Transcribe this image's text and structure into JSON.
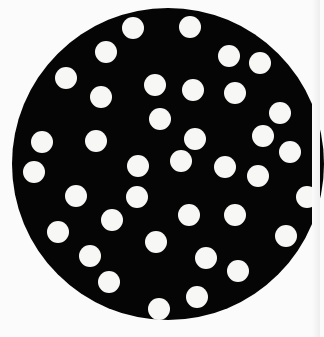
{
  "image": {
    "description": "Black circular disc with scattered white dots on a white background",
    "background_color": "#fbfbfb",
    "disc": {
      "cx": 168,
      "cy": 164,
      "r": 156,
      "color": "#050505"
    },
    "dot_color": "#f7f7f5",
    "dot_radius": 11,
    "dots": [
      {
        "x": 133,
        "y": 28
      },
      {
        "x": 190,
        "y": 27
      },
      {
        "x": 106,
        "y": 52
      },
      {
        "x": 229,
        "y": 56
      },
      {
        "x": 260,
        "y": 63
      },
      {
        "x": 66,
        "y": 78
      },
      {
        "x": 155,
        "y": 85
      },
      {
        "x": 193,
        "y": 90
      },
      {
        "x": 235,
        "y": 93
      },
      {
        "x": 101,
        "y": 97
      },
      {
        "x": 160,
        "y": 119
      },
      {
        "x": 280,
        "y": 113
      },
      {
        "x": 42,
        "y": 142
      },
      {
        "x": 96,
        "y": 141
      },
      {
        "x": 195,
        "y": 139
      },
      {
        "x": 263,
        "y": 136
      },
      {
        "x": 290,
        "y": 152
      },
      {
        "x": 34,
        "y": 172
      },
      {
        "x": 138,
        "y": 166
      },
      {
        "x": 181,
        "y": 161
      },
      {
        "x": 225,
        "y": 167
      },
      {
        "x": 258,
        "y": 176
      },
      {
        "x": 76,
        "y": 196
      },
      {
        "x": 137,
        "y": 197
      },
      {
        "x": 307,
        "y": 197
      },
      {
        "x": 112,
        "y": 220
      },
      {
        "x": 189,
        "y": 215
      },
      {
        "x": 235,
        "y": 215
      },
      {
        "x": 58,
        "y": 232
      },
      {
        "x": 286,
        "y": 236
      },
      {
        "x": 156,
        "y": 242
      },
      {
        "x": 90,
        "y": 256
      },
      {
        "x": 206,
        "y": 258
      },
      {
        "x": 109,
        "y": 282
      },
      {
        "x": 238,
        "y": 271
      },
      {
        "x": 159,
        "y": 309
      },
      {
        "x": 197,
        "y": 297
      }
    ]
  }
}
